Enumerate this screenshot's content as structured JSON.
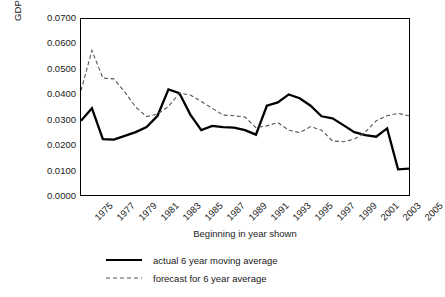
{
  "chart_data": {
    "type": "line",
    "title": "",
    "xlabel": "Beginning in year shown",
    "ylabel": "GDP growth (actual and forecast)",
    "xlim": [
      1975,
      2005
    ],
    "ylim": [
      0.0,
      0.07
    ],
    "yticks": [
      "0.0700",
      "0.0600",
      "0.0500",
      "0.0400",
      "0.0300",
      "0.0200",
      "0.0100",
      "0.0000"
    ],
    "ytick_values": [
      0.07,
      0.06,
      0.05,
      0.04,
      0.03,
      0.02,
      0.01,
      0.0
    ],
    "xticks": [
      "1975",
      "1977",
      "1979",
      "1981",
      "1983",
      "1985",
      "1987",
      "1989",
      "1991",
      "1993",
      "1995",
      "1997",
      "1999",
      "2001",
      "2003",
      "2005"
    ],
    "xtick_values": [
      1975,
      1977,
      1979,
      1981,
      1983,
      1985,
      1987,
      1989,
      1991,
      1993,
      1995,
      1997,
      1999,
      2001,
      2003,
      2005
    ],
    "grid": false,
    "legend_position": "below",
    "x": [
      1975,
      1976,
      1977,
      1978,
      1979,
      1980,
      1981,
      1982,
      1983,
      1984,
      1985,
      1986,
      1987,
      1988,
      1989,
      1990,
      1991,
      1992,
      1993,
      1994,
      1995,
      1996,
      1997,
      1998,
      1999,
      2000,
      2001,
      2002,
      2003,
      2004,
      2005
    ],
    "series": [
      {
        "name": "actual 6 year moving average",
        "style": "solid",
        "color": "#000000",
        "values": [
          0.0295,
          0.0345,
          0.0222,
          0.022,
          0.0235,
          0.025,
          0.027,
          0.0315,
          0.042,
          0.0405,
          0.032,
          0.0258,
          0.0275,
          0.027,
          0.0268,
          0.0258,
          0.024,
          0.0355,
          0.0368,
          0.04,
          0.0385,
          0.0355,
          0.0313,
          0.0305,
          0.0278,
          0.025,
          0.0238,
          0.0232,
          0.0265,
          0.0102,
          0.0105
        ]
      },
      {
        "name": "forecast for 6 year average",
        "style": "dashed",
        "color": "#555555",
        "values": [
          0.0415,
          0.0575,
          0.0465,
          0.0462,
          0.041,
          0.035,
          0.0312,
          0.0322,
          0.0352,
          0.0405,
          0.0398,
          0.0372,
          0.0345,
          0.0318,
          0.0315,
          0.031,
          0.0268,
          0.0275,
          0.0288,
          0.0258,
          0.0248,
          0.0272,
          0.0258,
          0.0215,
          0.0212,
          0.0222,
          0.025,
          0.0295,
          0.0315,
          0.0325,
          0.0315
        ]
      }
    ],
    "legend": [
      {
        "label": "actual 6 year moving average",
        "style": "solid"
      },
      {
        "label": "forecast for 6 year average",
        "style": "dashed"
      }
    ]
  }
}
